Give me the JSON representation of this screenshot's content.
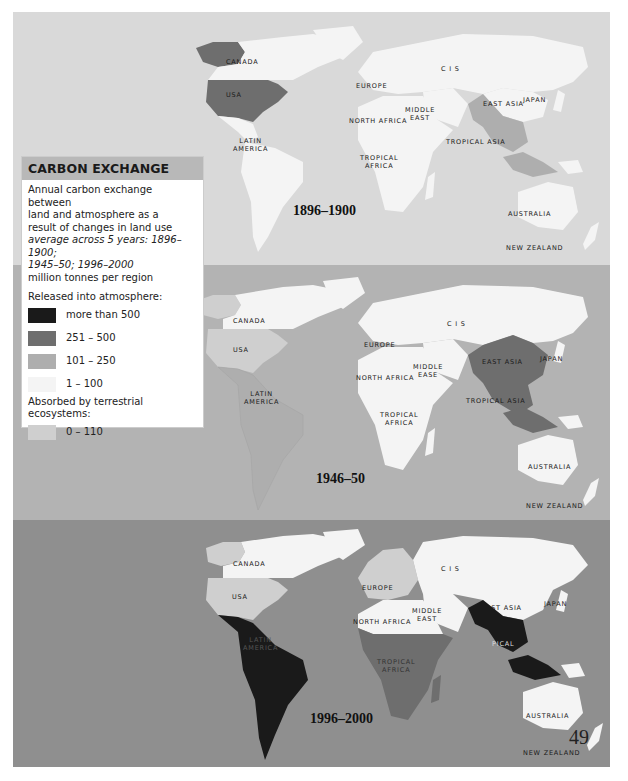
{
  "legend": {
    "title": "CARBON EXCHANGE",
    "description_lines": [
      "Annual carbon exchange between",
      "land and atmosphere as a",
      "result of changes in land use"
    ],
    "italic_lines": [
      "average across 5 years: 1896–1900;",
      "1945–50; 1996–2000"
    ],
    "unit": "million tonnes per region",
    "released_heading": "Released into atmosphere:",
    "absorbed_heading": "Absorbed by terrestrial ecosystems:",
    "released_items": [
      {
        "label": "more than 500",
        "color": "#1a1a1a"
      },
      {
        "label": "251 – 500",
        "color": "#6e6e6e"
      },
      {
        "label": "101 – 250",
        "color": "#aeaeae"
      },
      {
        "label": "1 – 100",
        "color": "#f4f4f4"
      }
    ],
    "absorbed_items": [
      {
        "label": "0 – 110",
        "color": "#cfcfcf"
      }
    ]
  },
  "panels": [
    {
      "year": "1896–1900",
      "labels": {
        "canada": "CANADA",
        "usa": "USA",
        "latin_america_1": "LATIN",
        "latin_america_2": "AMERICA",
        "europe": "EUROPE",
        "cis": "C I S",
        "middle_east_1": "MIDDLE",
        "middle_east_2": "EAST",
        "north_africa": "NORTH AFRICA",
        "tropical_africa_1": "TROPICAL",
        "tropical_africa_2": "AFRICA",
        "east_asia": "EAST ASIA",
        "japan": "JAPAN",
        "tropical_asia": "TROPICAL ASIA",
        "australia": "AUSTRALIA",
        "new_zealand": "NEW ZEALAND"
      },
      "region_categories": {
        "usa": "251-500",
        "canada": "1-100",
        "latin_america": "1-100",
        "europe": "1-100",
        "cis": "1-100",
        "middle_east": "1-100",
        "north_africa": "1-100",
        "tropical_africa": "1-100",
        "east_asia": "1-100",
        "japan": "1-100",
        "tropical_asia": "101-250",
        "australia": "1-100",
        "new_zealand": "1-100"
      }
    },
    {
      "year": "1946–50",
      "labels": {
        "canada": "CANADA",
        "usa": "USA",
        "latin_america_1": "LATIN",
        "latin_america_2": "AMERICA",
        "europe": "EUROPE",
        "cis": "C I S",
        "middle_east_1": "MIDDLE",
        "middle_east_2": "EASE",
        "north_africa": "NORTH AFRICA",
        "tropical_africa_1": "TROPICAL",
        "tropical_africa_2": "AFRICA",
        "east_asia": "EAST ASIA",
        "japan": "JAPAN",
        "tropical_asia": "TROPICAL ASIA",
        "australia": "AUSTRALIA",
        "new_zealand": "NEW ZEALAND"
      },
      "region_categories": {
        "usa": "absorbed 0-110",
        "canada": "1-100",
        "latin_america": "101-250",
        "europe": "1-100",
        "cis": "1-100",
        "middle_east": "1-100",
        "north_africa": "1-100",
        "tropical_africa": "1-100",
        "east_asia": "251-500",
        "japan": "1-100",
        "tropical_asia": "251-500",
        "australia": "1-100",
        "new_zealand": "1-100"
      }
    },
    {
      "year": "1996–2000",
      "labels": {
        "canada": "CANADA",
        "usa": "USA",
        "latin_america_1": "LATIN",
        "latin_america_2": "AMERICA",
        "europe": "EUROPE",
        "cis": "C I S",
        "middle_east_1": "MIDDLE",
        "middle_east_2": "EAST",
        "north_africa": "NORTH AFRICA",
        "tropical_africa_1": "TROPICAL",
        "tropical_africa_2": "AFRICA",
        "east_asia": "EAST ASIA",
        "japan": "JAPAN",
        "tropical_asia": "PICAL",
        "australia": "AUSTRALIA",
        "new_zealand": "NEW ZEALAND"
      },
      "region_categories": {
        "usa": "absorbed 0-110",
        "canada": "1-100",
        "latin_america": "more than 500",
        "europe": "absorbed 0-110",
        "cis": "1-100",
        "middle_east": "1-100",
        "north_africa": "1-100",
        "tropical_africa": "251-500",
        "east_asia": "1-100",
        "japan": "1-100",
        "tropical_asia": "more than 500",
        "australia": "1-100",
        "new_zealand": "1-100"
      }
    }
  ],
  "page_number": "49",
  "colors": {
    "panel1_bg": "#d9d9d9",
    "panel2_bg": "#b3b3b3",
    "panel3_bg": "#8f8f8f",
    "gt500": "#1a1a1a",
    "c251_500": "#6e6e6e",
    "c101_250": "#aeaeae",
    "c1_100": "#f4f4f4",
    "absorbed": "#cfcfcf"
  }
}
